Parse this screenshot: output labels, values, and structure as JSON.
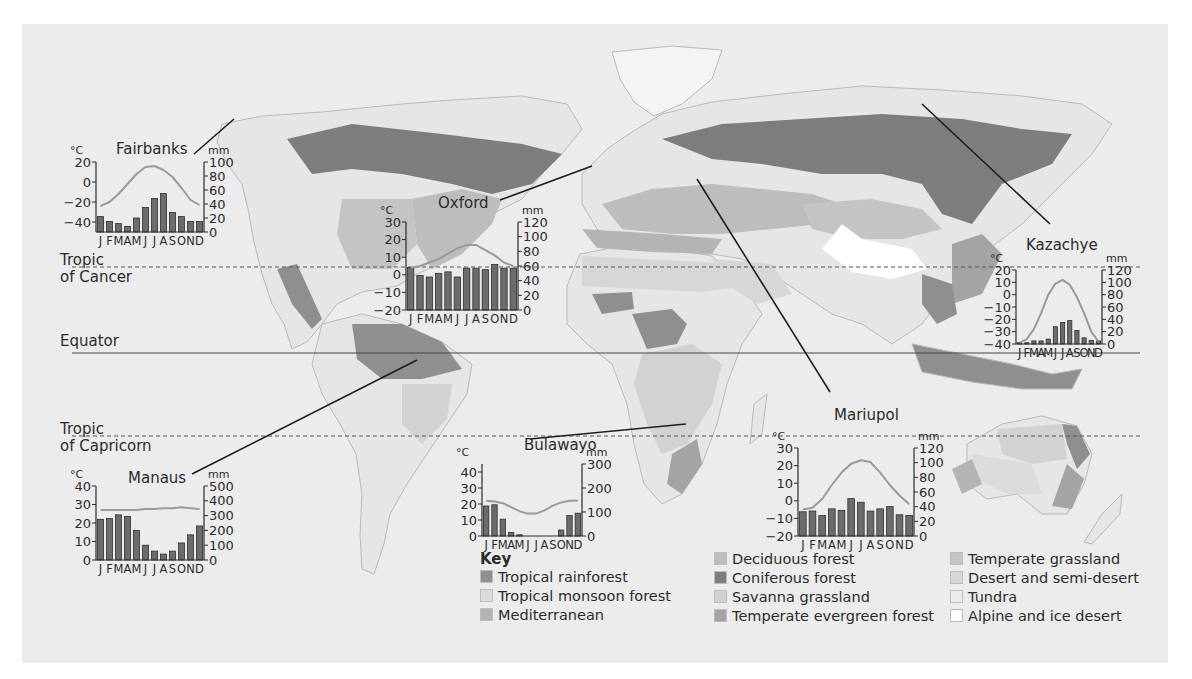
{
  "latitude_lines": {
    "tropic_of_cancer": {
      "line1": "Tropic",
      "line2": "of Cancer"
    },
    "equator": "Equator",
    "tropic_of_capricorn": {
      "line1": "Tropic",
      "line2": "of Capricorn"
    }
  },
  "key": {
    "title": "Key",
    "items": [
      {
        "label": "Tropical rainforest",
        "color": "#8f8f8f"
      },
      {
        "label": "Tropical monsoon forest",
        "color": "#dcdcdc"
      },
      {
        "label": "Mediterranean",
        "color": "#b4b4b4"
      },
      {
        "label": "Deciduous forest",
        "color": "#bdbdbd"
      },
      {
        "label": "Coniferous forest",
        "color": "#7d7d7d"
      },
      {
        "label": "Savanna grassland",
        "color": "#d2d2d2"
      },
      {
        "label": "Temperate evergreen forest",
        "color": "#a4a4a4"
      },
      {
        "label": "Temperate grassland",
        "color": "#c4c4c4"
      },
      {
        "label": "Desert and semi-desert",
        "color": "#d7d7d7"
      },
      {
        "label": "Tundra",
        "color": "#ececec"
      },
      {
        "label": "Alpine and ice desert",
        "color": "#ffffff"
      }
    ]
  },
  "chart_data": [
    {
      "type": "bar+line",
      "title": "Fairbanks",
      "categories": [
        "J",
        "F",
        "M",
        "A",
        "M",
        "J",
        "J",
        "A",
        "S",
        "O",
        "N",
        "D"
      ],
      "month_label": "J FMAMJ JASOND",
      "ylabel_left": "°C",
      "ylabel_right": "mm",
      "temp_ticks": [
        20,
        0,
        -20,
        -40
      ],
      "temp_range": [
        -50,
        20
      ],
      "precip_ticks": [
        100,
        80,
        60,
        40,
        20,
        0
      ],
      "precip_range": [
        0,
        100
      ],
      "series": [
        {
          "name": "Precipitation (mm)",
          "kind": "bar",
          "values": [
            22,
            15,
            12,
            8,
            20,
            35,
            48,
            55,
            28,
            22,
            15,
            15
          ]
        },
        {
          "name": "Temperature (°C)",
          "kind": "line",
          "values": [
            -24,
            -20,
            -12,
            -2,
            8,
            15,
            16,
            12,
            5,
            -6,
            -18,
            -23
          ]
        }
      ]
    },
    {
      "type": "bar+line",
      "title": "Oxford",
      "categories": [
        "J",
        "F",
        "M",
        "A",
        "M",
        "J",
        "J",
        "A",
        "S",
        "O",
        "N",
        "D"
      ],
      "month_label": "J FMAMJ JASOND",
      "ylabel_left": "°C",
      "ylabel_right": "mm",
      "temp_ticks": [
        30,
        20,
        10,
        0,
        -10,
        -20
      ],
      "temp_range": [
        -20,
        30
      ],
      "precip_ticks": [
        120,
        100,
        80,
        60,
        40,
        20,
        0
      ],
      "precip_range": [
        0,
        120
      ],
      "series": [
        {
          "name": "Precipitation (mm)",
          "kind": "bar",
          "values": [
            58,
            47,
            45,
            50,
            52,
            45,
            57,
            57,
            55,
            62,
            57,
            57
          ]
        },
        {
          "name": "Temperature (°C)",
          "kind": "line",
          "values": [
            4,
            5,
            7,
            9,
            12,
            15,
            17,
            17,
            14,
            11,
            7,
            5
          ]
        }
      ]
    },
    {
      "type": "bar+line",
      "title": "Kazachye",
      "categories": [
        "J",
        "F",
        "M",
        "A",
        "M",
        "J",
        "J",
        "A",
        "S",
        "O",
        "N",
        "D"
      ],
      "month_label": "J FMAMJ JASOND",
      "ylabel_left": "°C",
      "ylabel_right": "mm",
      "temp_ticks": [
        20,
        10,
        0,
        -10,
        -20,
        -30,
        -40
      ],
      "temp_range": [
        -40,
        20
      ],
      "precip_ticks": [
        120,
        100,
        80,
        60,
        40,
        20,
        0
      ],
      "precip_range": [
        0,
        120
      ],
      "series": [
        {
          "name": "Precipitation (mm)",
          "kind": "bar",
          "values": [
            2,
            2,
            5,
            5,
            8,
            28,
            35,
            38,
            22,
            10,
            6,
            5
          ]
        },
        {
          "name": "Temperature (°C)",
          "kind": "line",
          "values": [
            -39,
            -36,
            -28,
            -15,
            0,
            9,
            12,
            8,
            -2,
            -15,
            -30,
            -38
          ]
        }
      ]
    },
    {
      "type": "bar+line",
      "title": "Manaus",
      "categories": [
        "J",
        "F",
        "M",
        "A",
        "M",
        "J",
        "J",
        "A",
        "S",
        "O",
        "N",
        "D"
      ],
      "month_label": "J FMAMJ JASOND",
      "ylabel_left": "°C",
      "ylabel_right": "mm",
      "temp_ticks": [
        40,
        30,
        20,
        10,
        0
      ],
      "temp_range": [
        0,
        40
      ],
      "precip_ticks": [
        500,
        400,
        300,
        200,
        100,
        0
      ],
      "precip_range": [
        0,
        500
      ],
      "series": [
        {
          "name": "Precipitation (mm)",
          "kind": "bar",
          "values": [
            275,
            280,
            305,
            295,
            200,
            100,
            60,
            40,
            60,
            115,
            170,
            230
          ]
        },
        {
          "name": "Temperature (°C)",
          "kind": "line",
          "values": [
            27,
            27,
            27,
            27,
            27,
            27.5,
            27.5,
            28,
            28,
            28.5,
            28,
            27.5
          ]
        }
      ]
    },
    {
      "type": "bar+line",
      "title": "Bulawayo",
      "categories": [
        "J",
        "F",
        "M",
        "A",
        "M",
        "J",
        "J",
        "A",
        "S",
        "O",
        "N",
        "D"
      ],
      "month_label": "J FMAMJ JASOND",
      "ylabel_left": "°C",
      "ylabel_right": "mm",
      "temp_ticks": [
        40,
        30,
        20,
        10,
        0
      ],
      "temp_range": [
        0,
        45
      ],
      "precip_ticks": [
        300,
        200,
        100,
        0
      ],
      "precip_range": [
        0,
        300
      ],
      "series": [
        {
          "name": "Precipitation (mm)",
          "kind": "bar",
          "values": [
            125,
            130,
            70,
            15,
            5,
            0,
            0,
            0,
            0,
            25,
            85,
            95
          ]
        },
        {
          "name": "Temperature (°C)",
          "kind": "line",
          "values": [
            22,
            21.5,
            20.5,
            18,
            15.5,
            14,
            14,
            16,
            19,
            21,
            22,
            22
          ]
        }
      ]
    },
    {
      "type": "bar+line",
      "title": "Mariupol",
      "categories": [
        "J",
        "F",
        "M",
        "A",
        "M",
        "J",
        "J",
        "A",
        "S",
        "O",
        "N",
        "D"
      ],
      "month_label": "J FMAMJ JASOND",
      "ylabel_left": "°C",
      "ylabel_right": "mm",
      "temp_ticks": [
        30,
        20,
        10,
        0,
        -10,
        -20
      ],
      "temp_range": [
        -20,
        30
      ],
      "precip_ticks": [
        120,
        100,
        80,
        60,
        40,
        20,
        0
      ],
      "precip_range": [
        0,
        120
      ],
      "series": [
        {
          "name": "Precipitation (mm)",
          "kind": "bar",
          "values": [
            33,
            34,
            28,
            37,
            35,
            51,
            46,
            34,
            37,
            40,
            29,
            28
          ]
        },
        {
          "name": "Temperature (°C)",
          "kind": "line",
          "values": [
            -5,
            -4,
            1,
            9,
            16,
            21,
            23,
            22,
            16,
            9,
            3,
            -2
          ]
        }
      ]
    }
  ]
}
